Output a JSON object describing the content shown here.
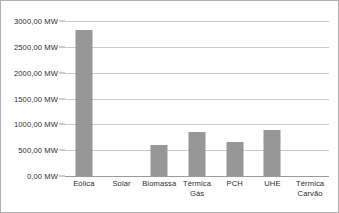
{
  "chart_data": {
    "type": "bar",
    "title": "",
    "subtitle": "",
    "xlabel": "",
    "ylabel": "",
    "unit": "MW",
    "categories": [
      "Eólica",
      "Solar",
      "Biomassa",
      "Térmica Gás",
      "PCH",
      "UHE",
      "Térmica Carvão"
    ],
    "category_lines": [
      [
        "Eólica"
      ],
      [
        "Solar"
      ],
      [
        "Biomassa"
      ],
      [
        "Térmica",
        "Gás"
      ],
      [
        "PCH"
      ],
      [
        "UHE"
      ],
      [
        "Térmica",
        "Carvão"
      ]
    ],
    "values": [
      2825,
      0,
      600,
      850,
      650,
      900,
      0
    ],
    "ylim": [
      0,
      3000
    ],
    "ytick_values": [
      0,
      500,
      1000,
      1500,
      2000,
      2500,
      3000
    ],
    "ytick_labels": [
      "0,00 MW",
      "500,00 MW",
      "1000,00 MW",
      "1500,00 MW",
      "2000,00 MW",
      "2500,00 MW",
      "3000,00 MW"
    ],
    "grid": true,
    "legend": false,
    "legend_position": "none",
    "bar_color": "#979797",
    "gridline_color": "#c9c9c9",
    "axis_color": "#9a9a9a",
    "text_color": "#2b2b2b",
    "background_color": "#ffffff",
    "border_color": "#b0b0b0"
  }
}
